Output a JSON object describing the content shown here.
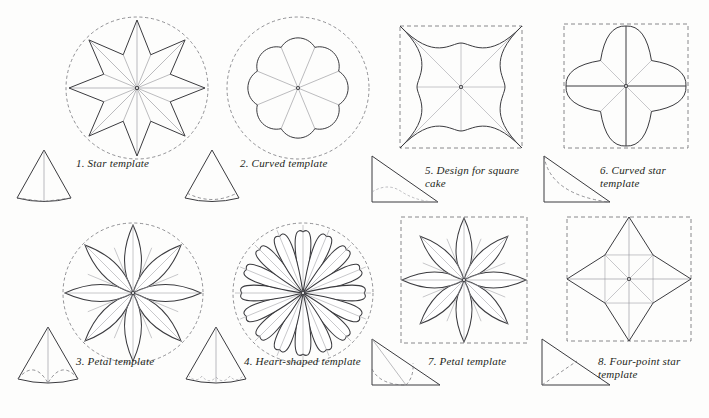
{
  "page": {
    "background_color": "#fdfdfc",
    "ink_color": "#3b3b3f",
    "guide_color": "#8e8e93"
  },
  "figures": [
    {
      "id": "star-template",
      "number": "1.",
      "label": "Star template",
      "caption": "1.  Star template",
      "master_shape": "eight-point-star-in-dashed-circle",
      "points": 8,
      "boundary": "dashed circle",
      "radial_lines": 16,
      "cone": {
        "type": "narrow-cone-curved-base",
        "fold_lines": "two dashed lines converging at base centre"
      }
    },
    {
      "id": "curved-template",
      "number": "2.",
      "label": "Curved template",
      "caption": "2.  Curved template",
      "master_shape": "eight-lobe-scallop-in-dashed-circle",
      "points": 8,
      "boundary": "dashed circle",
      "radial_lines": 8,
      "cone": {
        "type": "narrow-cone-curved-base",
        "fold_lines": "single dashed arc near base"
      }
    },
    {
      "id": "petal-template-round",
      "number": "3.",
      "label": "Petal template",
      "caption": "3.  Petal template",
      "master_shape": "eight-petal-rosette-in-dashed-circle",
      "points": 8,
      "boundary": "dashed circle",
      "radial_lines": 16,
      "cone": {
        "type": "narrow-cone-curved-base",
        "fold_lines": "two dashed petal curves meeting at base centre"
      }
    },
    {
      "id": "heart-shaped-template",
      "number": "4.",
      "label": "Heart-shaped template",
      "caption": "4.  Heart-shaped template",
      "master_shape": "sixteen-heart-lobe-rosette-in-dashed-circle",
      "points": 16,
      "boundary": "dashed circle",
      "radial_lines": 16,
      "cone": {
        "type": "narrow-cone-curved-base",
        "fold_lines": "scalloped dashed arc near base"
      }
    },
    {
      "id": "square-cake-design",
      "number": "5.",
      "label": "Design for square cake",
      "caption": "5.  Design for square\ncake",
      "master_shape": "four-concave-lobe-square-in-dashed-square",
      "points": 4,
      "boundary": "dashed square",
      "radial_lines": 4,
      "cone": {
        "type": "right-triangle",
        "fold_lines": "dashed wavy curve along base"
      }
    },
    {
      "id": "curved-star-template",
      "number": "6.",
      "label": "Curved star template",
      "caption": "6.  Curved star\ntemplate",
      "master_shape": "four-point-curved-star-in-dashed-square",
      "points": 4,
      "boundary": "dashed square",
      "radial_lines": 8,
      "cone": {
        "type": "right-triangle",
        "fold_lines": "dashed concave arc from apex to base"
      }
    },
    {
      "id": "petal-template-square",
      "number": "7.",
      "label": "Petal template",
      "caption": "7.  Petal template",
      "master_shape": "eight-petal-rosette-in-dashed-square",
      "points": 8,
      "boundary": "dashed square",
      "radial_lines": 16,
      "cone": {
        "type": "right-triangle",
        "fold_lines": "dashed petal curve plus grey guide line"
      }
    },
    {
      "id": "four-point-star-template",
      "number": "8.",
      "label": "Four-point star template",
      "caption": "8.  Four-point star\ntemplate",
      "master_shape": "four-point-straight-star-in-dashed-square",
      "points": 4,
      "boundary": "dashed square",
      "radial_lines": 8,
      "cone": {
        "type": "right-triangle",
        "fold_lines": "straight dashed line to hypotenuse midpoint"
      }
    }
  ]
}
